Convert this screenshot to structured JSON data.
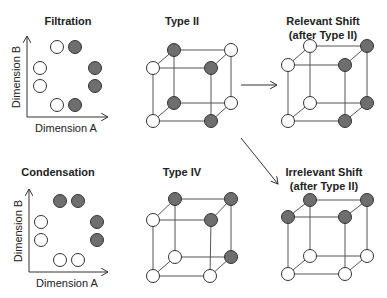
{
  "colors": {
    "filled": "#6e6e6e",
    "empty": "#ffffff",
    "stroke": "#333333",
    "edge": "#555555"
  },
  "panels": {
    "filtration": {
      "title": "Filtration",
      "x_label": "Dimension A",
      "y_label": "Dimension B",
      "points": [
        {
          "x": 57,
          "y": 47,
          "filled": false
        },
        {
          "x": 75,
          "y": 47,
          "filled": true
        },
        {
          "x": 40,
          "y": 68,
          "filled": false
        },
        {
          "x": 95,
          "y": 68,
          "filled": true
        },
        {
          "x": 40,
          "y": 86,
          "filled": false
        },
        {
          "x": 95,
          "y": 86,
          "filled": true
        },
        {
          "x": 57,
          "y": 105,
          "filled": false
        },
        {
          "x": 75,
          "y": 105,
          "filled": true
        }
      ]
    },
    "condensation": {
      "title": "Condensation",
      "x_label": "Dimension A",
      "y_label": "Dimension B",
      "points": [
        {
          "x": 60,
          "y": 201,
          "filled": true
        },
        {
          "x": 78,
          "y": 201,
          "filled": true
        },
        {
          "x": 41,
          "y": 222,
          "filled": false
        },
        {
          "x": 97,
          "y": 222,
          "filled": true
        },
        {
          "x": 41,
          "y": 240,
          "filled": false
        },
        {
          "x": 97,
          "y": 240,
          "filled": true
        },
        {
          "x": 60,
          "y": 260,
          "filled": false
        },
        {
          "x": 78,
          "y": 260,
          "filled": false
        }
      ]
    },
    "type_ii": {
      "title": "Type II",
      "nodes": {
        "btl": true,
        "btr": false,
        "ftl": false,
        "ftr": true,
        "bbl": true,
        "bbr": false,
        "fbl": false,
        "fbr": true
      }
    },
    "type_iv": {
      "title": "Type IV",
      "nodes": {
        "btl": true,
        "btr": true,
        "ftl": false,
        "ftr": true,
        "bbl": false,
        "bbr": true,
        "fbl": false,
        "fbr": false
      }
    },
    "relevant_shift": {
      "title": "Relevant Shift",
      "subtitle": "(after Type II)",
      "nodes": {
        "btl": false,
        "btr": true,
        "ftl": false,
        "ftr": true,
        "bbl": false,
        "bbr": true,
        "fbl": false,
        "fbr": true
      }
    },
    "irrelevant_shift": {
      "title": "Irrelevant Shift",
      "subtitle": "(after Type II)",
      "nodes": {
        "btl": true,
        "btr": true,
        "ftl": true,
        "ftr": true,
        "bbl": false,
        "bbr": false,
        "fbl": false,
        "fbr": false
      }
    }
  }
}
